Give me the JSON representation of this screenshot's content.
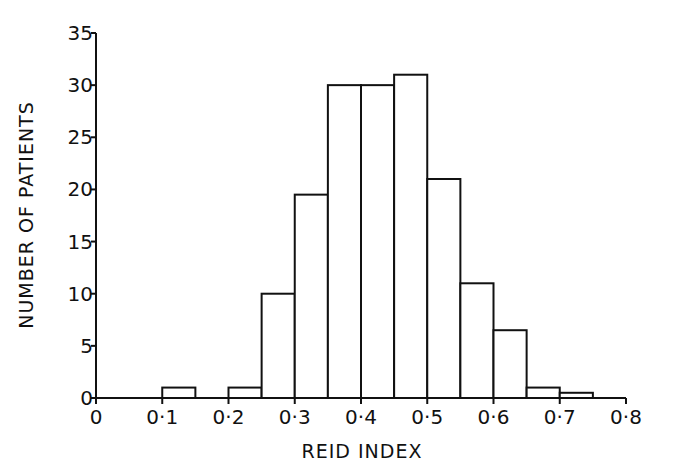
{
  "chart_data": {
    "type": "bar",
    "subtype": "histogram",
    "title": "",
    "xlabel": "REID INDEX",
    "ylabel": "NUMBER OF PATIENTS",
    "xlim": [
      0,
      0.8
    ],
    "ylim": [
      0,
      35
    ],
    "grid": false,
    "legend": null,
    "x_ticks": [
      "0",
      "0·1",
      "0·2",
      "0·3",
      "0·4",
      "0·5",
      "0·6",
      "0·7",
      "0·8"
    ],
    "x_tick_values": [
      0,
      0.1,
      0.2,
      0.3,
      0.4,
      0.5,
      0.6,
      0.7,
      0.8
    ],
    "y_ticks": [
      "0",
      "5",
      "10",
      "15",
      "20",
      "25",
      "30",
      "35"
    ],
    "y_tick_values": [
      0,
      5,
      10,
      15,
      20,
      25,
      30,
      35
    ],
    "bin_width": 0.05,
    "bins": [
      {
        "start": 0.1,
        "end": 0.15,
        "value": 1
      },
      {
        "start": 0.2,
        "end": 0.25,
        "value": 1
      },
      {
        "start": 0.25,
        "end": 0.3,
        "value": 10
      },
      {
        "start": 0.3,
        "end": 0.35,
        "value": 19.5
      },
      {
        "start": 0.35,
        "end": 0.4,
        "value": 30
      },
      {
        "start": 0.4,
        "end": 0.45,
        "value": 30
      },
      {
        "start": 0.45,
        "end": 0.5,
        "value": 31
      },
      {
        "start": 0.5,
        "end": 0.55,
        "value": 21
      },
      {
        "start": 0.55,
        "end": 0.6,
        "value": 11
      },
      {
        "start": 0.6,
        "end": 0.65,
        "value": 6.5
      },
      {
        "start": 0.65,
        "end": 0.7,
        "value": 1
      },
      {
        "start": 0.7,
        "end": 0.75,
        "value": 0.5
      }
    ],
    "categories": [
      "0.10-0.15",
      "0.20-0.25",
      "0.25-0.30",
      "0.30-0.35",
      "0.35-0.40",
      "0.40-0.45",
      "0.45-0.50",
      "0.50-0.55",
      "0.55-0.60",
      "0.60-0.65",
      "0.65-0.70",
      "0.70-0.75"
    ],
    "values": [
      1,
      1,
      10,
      19.5,
      30,
      30,
      31,
      21,
      11,
      6.5,
      1,
      0.5
    ]
  },
  "style": {
    "line_color": "#111111",
    "bar_fill": "#ffffff",
    "background": "#ffffff"
  }
}
